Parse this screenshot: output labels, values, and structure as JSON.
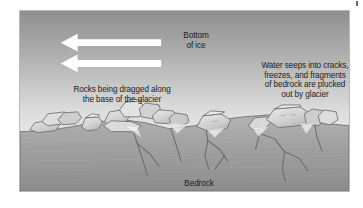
{
  "figure": {
    "frame_border_color": "#b9b9b9",
    "background_color": "#ffffff"
  },
  "scene": {
    "ice": {
      "name": "glacier-ice",
      "gradient_top_color": "#9a9a9a",
      "gradient_bottom_color": "#f2f2f2"
    },
    "bedrock": {
      "name": "bedrock-mass",
      "gradient_top_color": "#a8a8a8",
      "gradient_bottom_color": "#8e8e8e",
      "outline_color": "#6f6f6f"
    },
    "rocks": {
      "fill_color": "#d5d5d5",
      "shade_color": "#b0b0b0",
      "outline_color": "#6d6d6d",
      "count": 18
    },
    "fractures": {
      "name": "bedrock-cracks",
      "stroke_color": "#6b6b6b",
      "count": 9
    }
  },
  "arrows": {
    "color": "#ffffff",
    "direction": "left",
    "items": [
      {
        "name": "ice-flow-arrow-upper",
        "label": ""
      },
      {
        "name": "ice-flow-arrow-lower",
        "label": ""
      }
    ]
  },
  "labels": {
    "bottom_of_ice": "Bottom\nof ice",
    "rocks_dragged": "Rocks being dragged along\nthe base of the glacier",
    "water_seeps": "Water seeps into cracks,\nfreezes, and fragments\nof bedrock are plucked\nout by glacier",
    "bedrock": "Bedrock"
  },
  "text_color": "#1b1b1b"
}
